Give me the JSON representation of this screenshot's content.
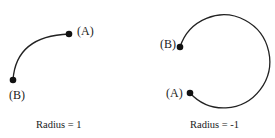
{
  "diagrams": [
    {
      "caption": "Radius = 1",
      "point_a_label": "(A)",
      "point_b_label": "(B)"
    },
    {
      "caption": "Radius = -1",
      "point_a_label": "(A)",
      "point_b_label": "(B)"
    }
  ],
  "colors": {
    "stroke": "#222222",
    "background": "#ffffff"
  }
}
